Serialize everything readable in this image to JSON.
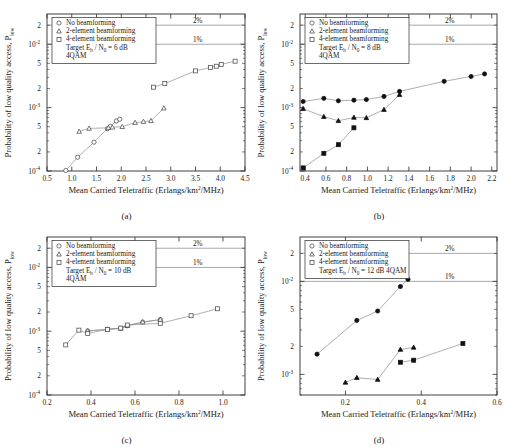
{
  "figure": {
    "panel_captions": [
      "(a)",
      "(b)",
      "(c)",
      "(d)"
    ],
    "axis": {
      "xlabel_main": "Mean Carried Teletraffic (Erlangs/km",
      "xlabel_sup": "2",
      "xlabel_tail": "/MHz)",
      "ylabel_main": "Probability of low quality access, P",
      "ylabel_sub": "low"
    },
    "legend": {
      "items": [
        {
          "marker": "circle-marker",
          "label": "No beamforming"
        },
        {
          "marker": "triangle-marker",
          "label": "2-element beamforming"
        },
        {
          "marker": "square-marker",
          "label": "4-element beamforming"
        }
      ]
    },
    "reference_lines": [
      {
        "label": "2%",
        "value": 0.02
      },
      {
        "label": "1%",
        "value": 0.01
      }
    ],
    "ytick_labels": [
      "10",
      "10",
      "10"
    ],
    "ytick_exponents": [
      "-2",
      "-3",
      "-4"
    ],
    "yminor_labels": [
      "2",
      "5"
    ]
  },
  "chart_data": [
    {
      "type": "scatter",
      "panel": "(a)",
      "title": "",
      "annotation_lines": [
        "Target E",
        "b",
        " / N",
        "0",
        " = 6 dB",
        "4QAM"
      ],
      "annotation_text": "Target Eb / N0 = 6 dB",
      "annotation_text2": "4QAM",
      "xlabel": "Mean Carried Teletraffic (Erlangs/km2/MHz)",
      "ylabel": "Probability of low quality access, Plow",
      "xlim": [
        0.5,
        4.5
      ],
      "ylim": [
        0.0001,
        0.03
      ],
      "xticks": [
        0.5,
        1.0,
        1.5,
        2.0,
        2.5,
        3.0,
        3.5,
        4.0,
        4.5
      ],
      "xtick_labels": [
        "0.5",
        "1.0",
        "1.5",
        "2.0",
        "2.5",
        "3.0",
        "3.5",
        "4.0",
        "4.5"
      ],
      "yscale": "log",
      "grid": false,
      "legend_position": "top-left",
      "series": [
        {
          "name": "No beamforming",
          "marker": "circle",
          "filled": false,
          "x": [
            0.88,
            1.12,
            1.45,
            1.72,
            1.78,
            1.9,
            1.97
          ],
          "y": [
            0.000102,
            0.000165,
            0.000285,
            0.000465,
            0.000505,
            0.000615,
            0.000655
          ]
        },
        {
          "name": "2-element beamforming",
          "marker": "triangle",
          "filled": false,
          "x": [
            1.15,
            1.35,
            1.74,
            1.82,
            2.02,
            2.28,
            2.45,
            2.6,
            2.86
          ],
          "y": [
            0.00042,
            0.00047,
            0.00048,
            0.00049,
            0.0005,
            0.00058,
            0.0006,
            0.00062,
            0.00098
          ]
        },
        {
          "name": "4-element beamforming",
          "marker": "square",
          "filled": false,
          "x": [
            2.65,
            2.88,
            3.5,
            3.8,
            3.92,
            4.02,
            4.3
          ],
          "y": [
            0.0021,
            0.0024,
            0.0038,
            0.0043,
            0.0045,
            0.0048,
            0.0054
          ]
        }
      ]
    },
    {
      "type": "scatter",
      "panel": "(b)",
      "title": "",
      "annotation_text": "Target Eb / N0 = 8 dB",
      "annotation_text2": "4QAM",
      "xlabel": "Mean Carried Teletraffic (Erlangs/km2/MHz)",
      "ylabel": "Probability of low quality access, Plow",
      "xlim": [
        0.35,
        2.25
      ],
      "ylim": [
        0.0001,
        0.03
      ],
      "xticks": [
        0.4,
        0.6,
        0.8,
        1.0,
        1.2,
        1.4,
        1.6,
        1.8,
        2.0,
        2.2
      ],
      "xtick_labels": [
        "0.4",
        "0.6",
        "0.8",
        "1.0",
        "1.2",
        "1.4",
        "1.6",
        "1.8",
        "2.0",
        "2.2"
      ],
      "yscale": "log",
      "grid": false,
      "legend_position": "top-left",
      "series": [
        {
          "name": "No beamforming",
          "marker": "circle",
          "filled": true,
          "x": [
            0.38,
            0.58,
            0.72,
            0.87,
            0.99,
            1.16,
            1.31,
            1.74,
            2.0,
            2.13
          ],
          "y": [
            0.00125,
            0.0014,
            0.00128,
            0.00131,
            0.00134,
            0.0015,
            0.0018,
            0.0026,
            0.0031,
            0.0034
          ]
        },
        {
          "name": "2-element beamforming",
          "marker": "triangle",
          "filled": true,
          "x": [
            0.38,
            0.58,
            0.72,
            0.87,
            0.99,
            1.16,
            1.31
          ],
          "y": [
            0.00096,
            0.00072,
            0.00062,
            0.0007,
            0.00069,
            0.00093,
            0.0016
          ]
        },
        {
          "name": "4-element beamforming",
          "marker": "square",
          "filled": true,
          "x": [
            0.38,
            0.58,
            0.72,
            0.87
          ],
          "y": [
            0.000112,
            0.00019,
            0.00026,
            0.00048
          ]
        }
      ]
    },
    {
      "type": "scatter",
      "panel": "(c)",
      "title": "",
      "annotation_text": "Target Eb / N0 = 10 dB",
      "annotation_text2": "4QAM",
      "xlabel": "Mean Carried Teletraffic (Erlangs/km2/MHz)",
      "ylabel": "Probability of low quality access, Plow",
      "xlim": [
        0.2,
        1.1
      ],
      "ylim": [
        0.0001,
        0.03
      ],
      "xticks": [
        0.2,
        0.4,
        0.6,
        0.8,
        1.0
      ],
      "xtick_labels": [
        "0.2",
        "0.4",
        "0.6",
        "0.8",
        "1.0"
      ],
      "yscale": "log",
      "grid": false,
      "legend_position": "top-left",
      "series": [
        {
          "name": "No beamforming",
          "marker": "circle",
          "filled": false,
          "x": [
            0.385,
            0.475,
            0.535,
            0.565,
            0.635,
            0.715
          ],
          "y": [
            0.00101,
            0.00107,
            0.00111,
            0.00122,
            0.00139,
            0.00152
          ]
        },
        {
          "name": "2-element beamforming",
          "marker": "triangle",
          "filled": false,
          "x": [
            0.385,
            0.475,
            0.535,
            0.565,
            0.635,
            0.715
          ],
          "y": [
            0.00101,
            0.00107,
            0.00111,
            0.00122,
            0.00139,
            0.00152
          ]
        },
        {
          "name": "4-element beamforming",
          "marker": "square",
          "filled": false,
          "x": [
            0.285,
            0.345,
            0.385,
            0.475,
            0.535,
            0.565,
            0.715,
            0.855,
            0.975
          ],
          "y": [
            0.00061,
            0.00104,
            0.00092,
            0.00107,
            0.00112,
            0.00125,
            0.00133,
            0.00175,
            0.00225
          ]
        }
      ]
    },
    {
      "type": "scatter",
      "panel": "(d)",
      "title": "",
      "annotation_text": "Target Eb / N0 = 12 dB 4QAM",
      "annotation_text2": "",
      "xlabel": "Mean Carried Teletraffic (Erlangs/km2/MHz)",
      "ylabel": "Probability of low quality access, Plow",
      "xlim": [
        0.08,
        0.6
      ],
      "ylim": [
        0.0006,
        0.03
      ],
      "xticks": [
        0.2,
        0.4,
        0.6
      ],
      "xtick_labels": [
        "0.2",
        "0.4",
        "0.6"
      ],
      "yscale": "log",
      "grid": false,
      "legend_position": "top-left",
      "series": [
        {
          "name": "No beamforming",
          "marker": "circle",
          "filled": true,
          "x": [
            0.125,
            0.23,
            0.285,
            0.345,
            0.365
          ],
          "y": [
            0.00165,
            0.0038,
            0.0048,
            0.0088,
            0.0105
          ]
        },
        {
          "name": "2-element beamforming",
          "marker": "triangle",
          "filled": true,
          "x": [
            0.2,
            0.23,
            0.285,
            0.345,
            0.38
          ],
          "y": [
            0.00082,
            0.00092,
            0.00088,
            0.00185,
            0.00195
          ]
        },
        {
          "name": "4-element beamforming",
          "marker": "square",
          "filled": true,
          "x": [
            0.345,
            0.38,
            0.51
          ],
          "y": [
            0.00135,
            0.00142,
            0.00215
          ]
        }
      ]
    }
  ]
}
